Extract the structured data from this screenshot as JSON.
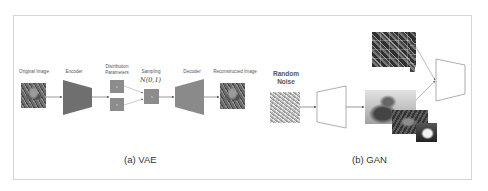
{
  "vae": {
    "labels": {
      "original_image": "Original Image",
      "encoder": "Encoder",
      "distribution_parameters_line1": "Distribution",
      "distribution_parameters_line2": "Parameters",
      "sampling": "Sampling",
      "sampling_formula": "N(0,1)",
      "decoder": "Decoder",
      "reconstructed_image": "Reconstructed Image"
    },
    "caption": "(a) VAE",
    "colors": {
      "encoder_fill": "#6f6f6f",
      "decoder_fill": "#8a8a8a",
      "param_box_fill": "#8c8c8c",
      "arrow": "#555555"
    }
  },
  "gan": {
    "labels": {
      "random_noise_line1": "Random",
      "random_noise_line2": "Noise",
      "generator": "Generator",
      "discriminator": "Discriminator"
    },
    "caption": "(b) GAN",
    "colors": {
      "block_stroke": "#777777",
      "block_fill": "#ffffff",
      "arrow": "#555555"
    }
  },
  "frame": {
    "border_color": "#d6d6d6",
    "background": "#ffffff"
  }
}
